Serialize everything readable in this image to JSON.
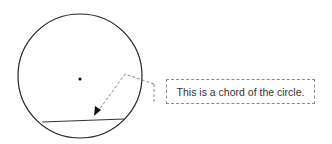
{
  "diagram": {
    "circle": {
      "cx": 80,
      "cy": 76,
      "r": 62,
      "stroke": "#222222"
    },
    "center_point": {
      "cx": 80,
      "cy": 79
    },
    "chord": {
      "x1": 42,
      "y1": 122,
      "x2": 124,
      "y2": 119
    },
    "callout": {
      "text": "This is a chord of the circle.",
      "line_color": "#8a8a8a"
    }
  }
}
